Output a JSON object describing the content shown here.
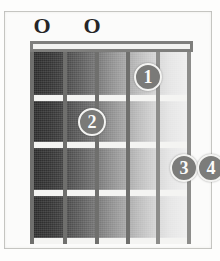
{
  "diagram": {
    "type": "guitar-chord-diagram",
    "strings_count": 6,
    "frets_count": 4,
    "nut_shown": true,
    "colors": {
      "page_background": "#fdfdfc",
      "frame_border": "#cfcfcb",
      "fretboard_dark": "#2b2b2b",
      "fretboard_light": "#f0f0f0",
      "fret_line": "#f4f4f2",
      "string_line": "#7d7d7b",
      "nut": "#7e7e7c",
      "marker_fill": "#6e6e6c",
      "marker_text": "#fbfbfa",
      "open_mark_text": "#262626"
    }
  },
  "open_markers": [
    {
      "label": "O",
      "string": 1,
      "x": 32
    },
    {
      "label": "O",
      "string": 3,
      "x": 82
    }
  ],
  "frets": [
    {
      "index": 1,
      "y": 54
    },
    {
      "index": 2,
      "y": 101
    },
    {
      "index": 3,
      "y": 149
    },
    {
      "index": 4,
      "y": 197
    }
  ],
  "strings": [
    {
      "index": 1,
      "x": 0,
      "shade": "dark"
    },
    {
      "index": 2,
      "x": 33,
      "shade": "dark"
    },
    {
      "index": 3,
      "x": 65,
      "shade": "dark"
    },
    {
      "index": 4,
      "x": 96,
      "shade": "dark"
    },
    {
      "index": 5,
      "x": 126,
      "shade": "light"
    },
    {
      "index": 6,
      "x": 157,
      "shade": "light"
    }
  ],
  "finger_markers": [
    {
      "label": "1",
      "string": 4,
      "fret": 1,
      "x": 104,
      "y": 22,
      "tone": "on-dark"
    },
    {
      "label": "2",
      "string": 2,
      "fret": 2,
      "x": 48,
      "y": 67,
      "tone": "on-dark"
    },
    {
      "label": "3",
      "string": 5,
      "fret": 3,
      "x": 140,
      "y": 113,
      "tone": "on-light"
    },
    {
      "label": "4",
      "string": 6,
      "fret": 3,
      "x": 167,
      "y": 113,
      "tone": "on-light"
    }
  ]
}
